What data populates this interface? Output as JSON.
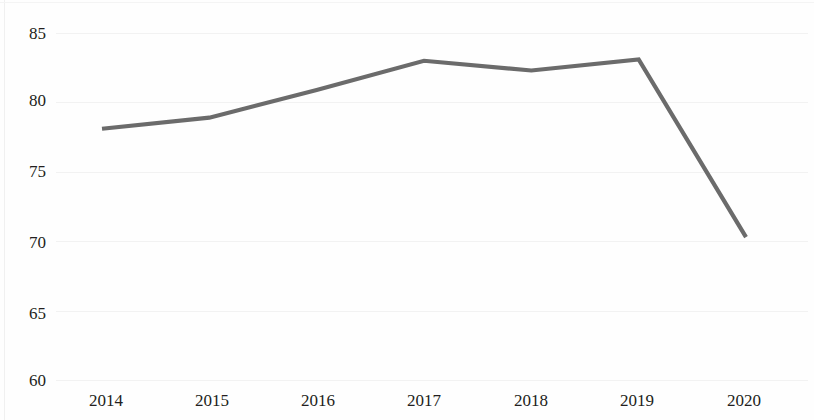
{
  "chart_data": {
    "type": "line",
    "title": "",
    "subtitle": "",
    "xlabel": "",
    "ylabel": "",
    "x": [
      2014,
      2015,
      2016,
      2017,
      2018,
      2019,
      2020
    ],
    "categories": [
      "2014",
      "2015",
      "2016",
      "2017",
      "2018",
      "2019",
      "2020"
    ],
    "series": [
      {
        "name": "",
        "values": [
          78.1,
          78.9,
          80.9,
          83.0,
          82.3,
          83.1,
          70.3
        ],
        "color": "#6b6b6b"
      }
    ],
    "ylim": [
      60,
      85
    ],
    "yticks": [
      85,
      80,
      75,
      70,
      65,
      60
    ],
    "ytick_labels": [
      "85",
      "80",
      "75",
      "70",
      "65",
      "60"
    ],
    "xticks": [
      2014,
      2015,
      2016,
      2017,
      2018,
      2019,
      2020
    ],
    "xtick_labels": [
      "2014",
      "2015",
      "2016",
      "2017",
      "2018",
      "2019",
      "2020"
    ],
    "grid": "horizontal-faint",
    "legend": "none",
    "annotations": []
  },
  "axes": {
    "y_labels": [
      "85",
      "80",
      "75",
      "70",
      "65",
      "60"
    ],
    "x_labels": [
      "2014",
      "2015",
      "2016",
      "2017",
      "2018",
      "2019",
      "2020"
    ]
  },
  "colors": {
    "line": "#6b6b6b",
    "text": "#231f20",
    "gridline": "#f2f2f2",
    "background": "#fefefe"
  }
}
